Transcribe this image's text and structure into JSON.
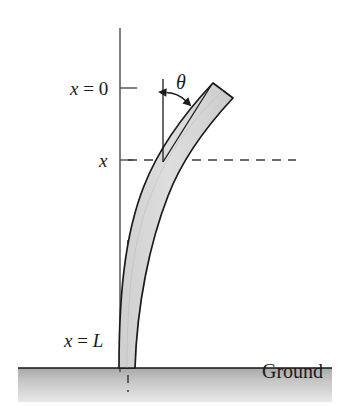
{
  "figure": {
    "labels": {
      "x_zero": {
        "var": "x",
        "eq": " = ",
        "value": "0"
      },
      "x_mid": {
        "var": "x"
      },
      "x_length": {
        "var": "x",
        "eq": " = ",
        "value": "L"
      },
      "theta": "θ",
      "ground": "Ground"
    },
    "colors": {
      "beam_fill": "#d9d9d9",
      "beam_stroke": "#1a1a1a",
      "axis": "#404040",
      "dashed": "#3a3a3a",
      "ground_top": "#b4b4b4",
      "ground_bottom": "#e2e2e2",
      "ground_line": "#1a1a1a",
      "text": "#1a1a1a",
      "background": "#ffffff"
    },
    "geometry": {
      "axis_x": 120,
      "axis_top_y": 28,
      "axis_bottom_y": 372,
      "tick_x0_y": 88,
      "tick_x_y": 160,
      "dashed_line_y": 160,
      "dashed_line_x_end": 296,
      "ground_y": 368,
      "ground_left": 18,
      "ground_right": 332,
      "ground_height": 34,
      "beam_base_x": 122,
      "beam_tip_x": 226,
      "beam_tip_y": 88,
      "theta_vertical_ref_x": 163,
      "theta_vertex_y": 160
    }
  }
}
